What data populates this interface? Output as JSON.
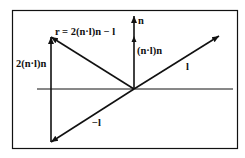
{
  "diagram": {
    "type": "vector reflection diagram",
    "labels": {
      "reflection": "r = 2(n·l)n − l",
      "normal": "n",
      "projection": "(n·l)n",
      "double_projection": "2(n·l)n",
      "light": "l",
      "neg_light": "−l"
    },
    "colors": {
      "stroke": "#111111",
      "background": "#ffffff"
    }
  }
}
